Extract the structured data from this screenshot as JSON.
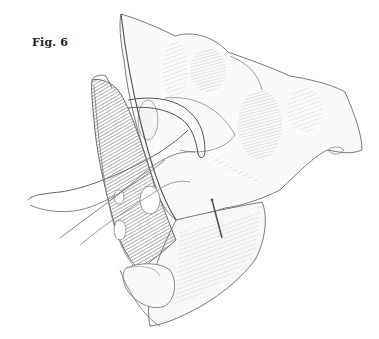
{
  "figure": {
    "label": "Fig. 6",
    "colors": {
      "background": "#ffffff",
      "line": "#555555",
      "shade_dark": "#6b6b6b",
      "shade_light": "#bdbdbd",
      "label": "#222222"
    }
  }
}
